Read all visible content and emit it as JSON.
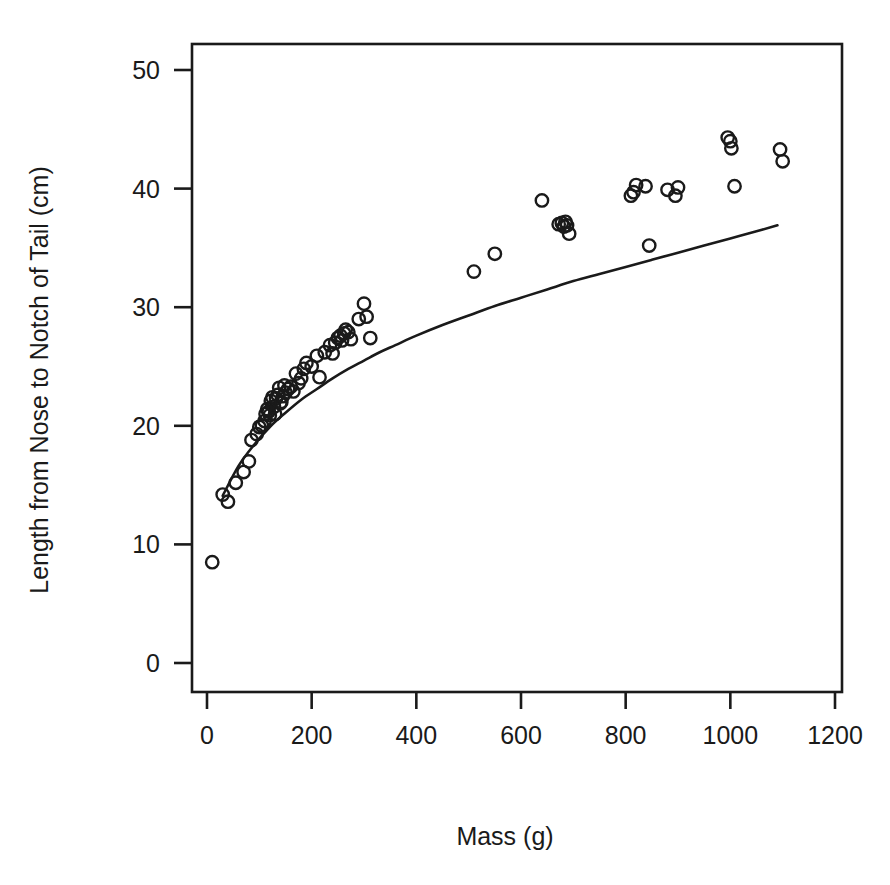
{
  "chart_data": {
    "type": "scatter",
    "title": "",
    "xlabel": "Mass (g)",
    "ylabel": "Length from Nose to Notch of Tail (cm)",
    "xlim": [
      -60,
      1260
    ],
    "ylim": [
      -2.5,
      53
    ],
    "grid": false,
    "legend": null,
    "marker": "open-circle",
    "xticks": [
      0,
      200,
      400,
      600,
      800,
      1000,
      1200
    ],
    "xtick_labels": [
      "0",
      "200",
      "400",
      "600",
      "800",
      "1000",
      "1200"
    ],
    "yticks": [
      0,
      10,
      20,
      30,
      40,
      50
    ],
    "ytick_labels": [
      "0",
      "10",
      "20",
      "30",
      "40",
      "50"
    ],
    "series": [
      {
        "name": "observations",
        "type": "scatter",
        "x": [
          10,
          30,
          40,
          55,
          70,
          80,
          85,
          95,
          100,
          105,
          110,
          112,
          115,
          118,
          120,
          122,
          125,
          128,
          130,
          132,
          135,
          138,
          140,
          142,
          145,
          148,
          150,
          155,
          160,
          165,
          170,
          175,
          180,
          185,
          190,
          200,
          210,
          215,
          225,
          235,
          240,
          245,
          250,
          255,
          258,
          262,
          265,
          270,
          275,
          290,
          300,
          305,
          312,
          510,
          550,
          640,
          672,
          678,
          682,
          685,
          688,
          692,
          810,
          815,
          820,
          838,
          845,
          880,
          895,
          900,
          995,
          1000,
          1002,
          1008,
          1095,
          1100
        ],
        "y": [
          8.5,
          14.2,
          13.6,
          15.2,
          16.1,
          17.0,
          18.8,
          19.3,
          19.9,
          20.0,
          20.4,
          21.0,
          21.4,
          21.2,
          20.9,
          22.1,
          22.4,
          21.6,
          21.0,
          22.3,
          22.6,
          23.2,
          21.9,
          22.0,
          22.5,
          23.4,
          22.8,
          23.1,
          23.3,
          22.9,
          24.4,
          23.6,
          24.0,
          24.8,
          25.3,
          25.0,
          25.9,
          24.1,
          26.2,
          26.8,
          26.1,
          27.0,
          27.4,
          27.6,
          27.2,
          27.8,
          28.1,
          27.9,
          27.3,
          29.0,
          30.3,
          29.2,
          27.4,
          33.0,
          34.5,
          39.0,
          37.0,
          37.1,
          36.8,
          37.2,
          36.9,
          36.2,
          39.4,
          39.7,
          40.3,
          40.2,
          35.2,
          39.9,
          39.4,
          40.1,
          44.3,
          44.0,
          43.4,
          40.2,
          43.3,
          42.3
        ]
      },
      {
        "name": "fitted-curve",
        "type": "line",
        "x": [
          30,
          60,
          90,
          120,
          150,
          180,
          210,
          240,
          270,
          300,
          330,
          360,
          400,
          450,
          500,
          550,
          600,
          650,
          700,
          750,
          800,
          850,
          900,
          950,
          1000,
          1050,
          1090
        ],
        "y": [
          14.1,
          16.6,
          18.4,
          19.9,
          21.1,
          22.2,
          23.1,
          24.0,
          24.8,
          25.5,
          26.2,
          26.8,
          27.6,
          28.5,
          29.3,
          30.1,
          30.8,
          31.5,
          32.2,
          32.8,
          33.4,
          34.0,
          34.6,
          35.2,
          35.8,
          36.4,
          36.9
        ]
      }
    ]
  },
  "axes": {
    "x_axis_label": "Mass (g)",
    "y_axis_label": "Length from Nose to Notch of Tail (cm)"
  },
  "style": {
    "marker_color": "#1a1a1a",
    "line_color": "#1a1a1a",
    "frame_color": "#1a1a1a",
    "background": "#ffffff"
  }
}
